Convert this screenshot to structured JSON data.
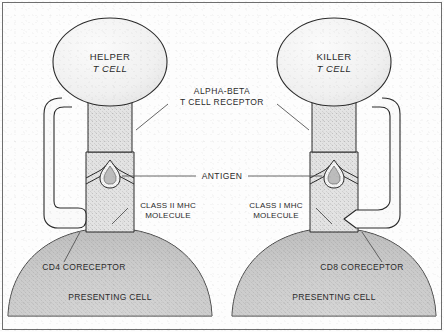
{
  "figure": {
    "kind": "immunology-diagram",
    "background_color": "#fdfdfd",
    "ink_color": "#2b2b2b",
    "frame": {
      "visible": true,
      "color": "#6e6e6e"
    }
  },
  "labels": {
    "helper_cell_line1": "HELPER",
    "helper_cell_line2": "T CELL",
    "killer_cell_line1": "KILLER",
    "killer_cell_line2": "T CELL",
    "receptor_line1": "ALPHA-BETA",
    "receptor_line2": "T CELL RECEPTOR",
    "antigen": "ANTIGEN",
    "mhc_class2_line1": "CLASS II MHC",
    "mhc_class2_line2": "MOLECULE",
    "mhc_class1_line1": "CLASS I MHC",
    "mhc_class1_line2": "MOLECULE",
    "cd4_coreceptor": "CD4 CORECEPTOR",
    "cd8_coreceptor": "CD8 CORECEPTOR",
    "presenting_cell_left": "PRESENTING CELL",
    "presenting_cell_right": "PRESENTING CELL"
  },
  "structures": {
    "left": {
      "t_cell_type": "helper",
      "receptor": "alpha-beta T cell receptor",
      "coreceptor": "CD4",
      "mhc_class": "Class II MHC",
      "antigen_shape": "teardrop",
      "presenting_cell": "antigen presenting cell"
    },
    "right": {
      "t_cell_type": "killer",
      "receptor": "alpha-beta T cell receptor",
      "coreceptor": "CD8",
      "mhc_class": "Class I MHC",
      "antigen_shape": "teardrop",
      "presenting_cell": "antigen presenting cell"
    }
  },
  "colors": {
    "cell_fill": "#f2f2f2",
    "stalk_fill": "#dedede",
    "presenting_fill": "#c9c9c9",
    "outline": "#2b2b2b",
    "leader_line": "#555555"
  }
}
